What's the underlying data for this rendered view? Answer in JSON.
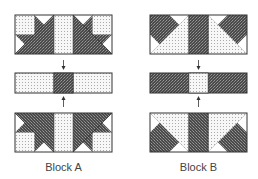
{
  "blocks": [
    {
      "id": "A",
      "label": "Block A",
      "center_color": "dark",
      "corner_color": "light"
    },
    {
      "id": "B",
      "label": "Block B",
      "center_color": "light",
      "corner_color": "dark"
    }
  ],
  "colors": {
    "light_fill": "#f4f4f4",
    "dark_fill": "#555555",
    "outline": "#333333",
    "white": "#ffffff"
  }
}
